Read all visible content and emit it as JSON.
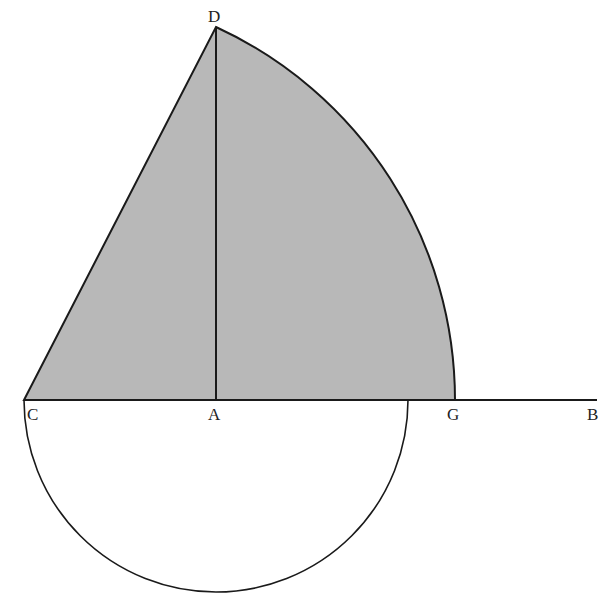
{
  "diagram": {
    "type": "geometric-construction",
    "labels": {
      "D": "D",
      "C": "C",
      "A": "A",
      "G": "G",
      "B": "B"
    },
    "points": {
      "C": [
        24,
        400
      ],
      "A": [
        216,
        400
      ],
      "D": [
        216,
        27
      ],
      "G": [
        455,
        400
      ],
      "B": [
        597,
        400
      ]
    },
    "colors": {
      "fill": "#b8b8b8",
      "stroke": "#1a1a1a",
      "label": "#222222"
    },
    "shapes": [
      {
        "name": "shaded-sector",
        "description": "Region bounded by segment C-D, arc D-G and segment G-C, shaded gray"
      },
      {
        "name": "perpendicular",
        "description": "Vertical segment A-D"
      },
      {
        "name": "baseline",
        "description": "Horizontal line from C through A and G to B"
      },
      {
        "name": "semicircle",
        "description": "Lower semicircle on diameter from C, centered at A, radius about 192"
      }
    ]
  }
}
